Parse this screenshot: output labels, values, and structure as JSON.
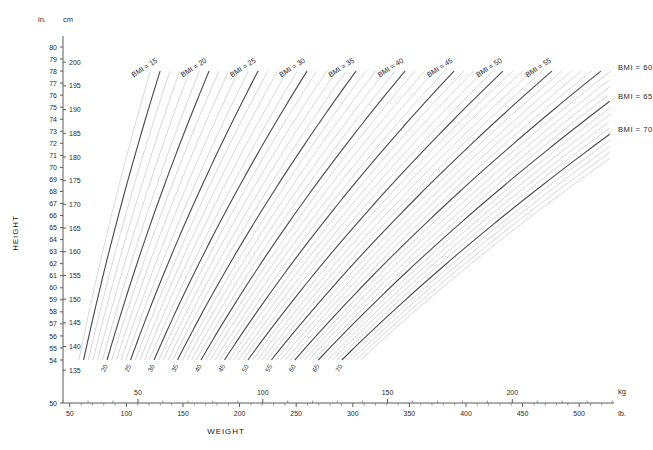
{
  "chart_data": {
    "type": "line",
    "xlabel": "WEIGHT",
    "ylabel": "HEIGHT",
    "grid": false,
    "legend_position": "inline-curve-labels",
    "x_axes": [
      {
        "name": "kg",
        "unit_label": "kg",
        "position": "top-of-axis",
        "range": [
          20,
          240
        ],
        "major_ticks": [
          50,
          100,
          150,
          200
        ],
        "major_tick_labels": [
          "50",
          "100",
          "150",
          "200"
        ],
        "minor_tick_step": 10
      },
      {
        "name": "lb",
        "unit_label": "lb.",
        "position": "bottom-of-axis",
        "range": [
          44,
          529
        ],
        "major_ticks": [
          50,
          100,
          150,
          200,
          250,
          300,
          350,
          400,
          450,
          500
        ],
        "major_tick_labels": [
          "50",
          "100",
          "150",
          "200",
          "250",
          "300",
          "350",
          "400",
          "450",
          "500"
        ],
        "minor_tick_step": 10
      }
    ],
    "y_axes": [
      {
        "name": "in",
        "unit_label": "in.",
        "position": "left-inner",
        "range": [
          54,
          80
        ],
        "ticks": [
          80,
          79,
          78,
          77,
          76,
          75,
          74,
          73,
          72,
          71,
          70,
          69,
          68,
          67,
          66,
          65,
          64,
          63,
          62,
          61,
          60,
          59,
          58,
          57,
          56,
          55,
          54
        ],
        "tick_labels": [
          "80",
          "79",
          "78",
          "77",
          "76",
          "75",
          "74",
          "73",
          "72",
          "71",
          "70",
          "69",
          "68",
          "67",
          "66",
          "65",
          "64",
          "63",
          "62",
          "61",
          "60",
          "59",
          "58",
          "57",
          "56",
          "55",
          "54"
        ],
        "detached_bottom_tick": "50"
      },
      {
        "name": "cm",
        "unit_label": "cm",
        "position": "left-outer",
        "range": [
          135,
          200
        ],
        "ticks": [
          200,
          195,
          190,
          185,
          180,
          175,
          170,
          165,
          160,
          155,
          150,
          145,
          140,
          135
        ],
        "tick_labels": [
          "200",
          "195",
          "190",
          "185",
          "180",
          "175",
          "170",
          "165",
          "160",
          "155",
          "150",
          "145",
          "140",
          "135"
        ]
      }
    ],
    "series_description": "Iso-BMI curves: weight = BMI x height_m^2. Major line every 5 BMI units, minor line every 1 BMI unit.",
    "bmi_major_values": [
      15,
      20,
      25,
      30,
      35,
      40,
      45,
      50,
      55,
      60,
      65,
      70
    ],
    "bmi_minor_step": 1,
    "bmi_minor_range": [
      14,
      74
    ],
    "labels_top_rotated": [
      {
        "text": "BMI = 15",
        "bmi": 15
      },
      {
        "text": "BMI = 20",
        "bmi": 20
      },
      {
        "text": "BMI = 25",
        "bmi": 25
      },
      {
        "text": "BMI = 30",
        "bmi": 30
      },
      {
        "text": "BMI = 35",
        "bmi": 35
      },
      {
        "text": "BMI = 40",
        "bmi": 40
      },
      {
        "text": "BMI = 45",
        "bmi": 45
      },
      {
        "text": "BMI = 50",
        "bmi": 50
      },
      {
        "text": "BMI = 55",
        "bmi": 55
      }
    ],
    "labels_right_horizontal": [
      {
        "text": "BMI = 60",
        "bmi": 60
      },
      {
        "text": "BMI = 65",
        "bmi": 65
      },
      {
        "text": "BMI = 70",
        "bmi": 70
      }
    ],
    "labels_bottom_rotated": [
      {
        "text": "20",
        "bmi": 20
      },
      {
        "text": "25",
        "bmi": 25
      },
      {
        "text": "30",
        "bmi": 30
      },
      {
        "text": "35",
        "bmi": 35
      },
      {
        "text": "40",
        "bmi": 40
      },
      {
        "text": "45",
        "bmi": 45
      },
      {
        "text": "50",
        "bmi": 50
      },
      {
        "text": "55",
        "bmi": 55
      },
      {
        "text": "60",
        "bmi": 60
      },
      {
        "text": "65",
        "bmi": 65
      },
      {
        "text": "70",
        "bmi": 70
      }
    ],
    "colors": {
      "background": "#ffffff",
      "major_line": "#4e4e55",
      "minor_line": "#c7c7cc",
      "axis": "#5a5a5a",
      "text": "#26262b"
    }
  },
  "axis_titles": {
    "height": "HEIGHT",
    "weight": "WEIGHT"
  },
  "units": {
    "inches": "in.",
    "centimeters": "cm",
    "kilograms": "kg",
    "pounds": "lb."
  }
}
